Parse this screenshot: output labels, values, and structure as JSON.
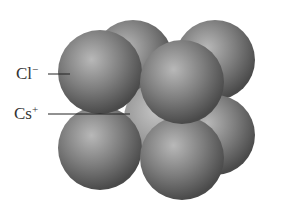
{
  "figure": {
    "colors": {
      "background": "#ffffff",
      "sphere_light": "#b8b8b8",
      "sphere_mid": "#7d7d7d",
      "sphere_dark": "#4a4a4a",
      "label_text": "#333333",
      "leader_line": "#222222"
    },
    "labels": [
      {
        "id": "cl",
        "symbol": "Cl",
        "charge": "−"
      },
      {
        "id": "cs",
        "symbol": "Cs",
        "charge": "+"
      }
    ]
  }
}
